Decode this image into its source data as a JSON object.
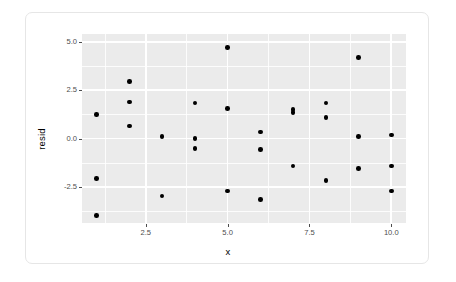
{
  "chart_data": {
    "type": "scatter",
    "title": "",
    "xlabel": "x",
    "ylabel": "resid",
    "xlim": [
      0.55,
      10.45
    ],
    "ylim": [
      -4.35,
      5.4
    ],
    "grid": true,
    "legend": null,
    "x_ticks": [
      2.5,
      5.0,
      7.5,
      10.0
    ],
    "x_tick_labels": [
      "2.5",
      "5.0",
      "7.5",
      "10.0"
    ],
    "y_ticks": [
      5.0,
      2.5,
      0.0,
      -2.5
    ],
    "y_tick_labels": [
      "5.0",
      "2.5",
      "0.0",
      "-2.5"
    ],
    "x_minor_ticks": [
      1.25,
      3.75,
      6.25,
      8.75
    ],
    "y_minor_ticks": [
      3.75,
      1.25,
      -1.25,
      -3.75
    ],
    "point_color": "#000000",
    "panel_color": "#ebebeb",
    "grid_color": "#ffffff",
    "points": [
      {
        "x": 1,
        "y": 1.25
      },
      {
        "x": 1,
        "y": -2.05
      },
      {
        "x": 1,
        "y": -3.95
      },
      {
        "x": 2,
        "y": 2.95
      },
      {
        "x": 2,
        "y": 1.9
      },
      {
        "x": 2,
        "y": 0.65
      },
      {
        "x": 3,
        "y": 0.1
      },
      {
        "x": 3,
        "y": -2.95
      },
      {
        "x": 4,
        "y": 1.85
      },
      {
        "x": 4,
        "y": 0.0
      },
      {
        "x": 4,
        "y": -0.5
      },
      {
        "x": 5,
        "y": 4.7
      },
      {
        "x": 5,
        "y": 1.55
      },
      {
        "x": 5,
        "y": -2.7
      },
      {
        "x": 6,
        "y": 0.35
      },
      {
        "x": 6,
        "y": -0.55
      },
      {
        "x": 6,
        "y": -3.15
      },
      {
        "x": 7,
        "y": 1.5
      },
      {
        "x": 7,
        "y": 1.35
      },
      {
        "x": 7,
        "y": -1.4
      },
      {
        "x": 8,
        "y": 1.85
      },
      {
        "x": 8,
        "y": 1.1
      },
      {
        "x": 8,
        "y": -2.15
      },
      {
        "x": 9,
        "y": 4.2
      },
      {
        "x": 9,
        "y": 0.1
      },
      {
        "x": 9,
        "y": -1.55
      },
      {
        "x": 10,
        "y": 0.2
      },
      {
        "x": 10,
        "y": -1.4
      },
      {
        "x": 10,
        "y": -2.7
      }
    ]
  }
}
